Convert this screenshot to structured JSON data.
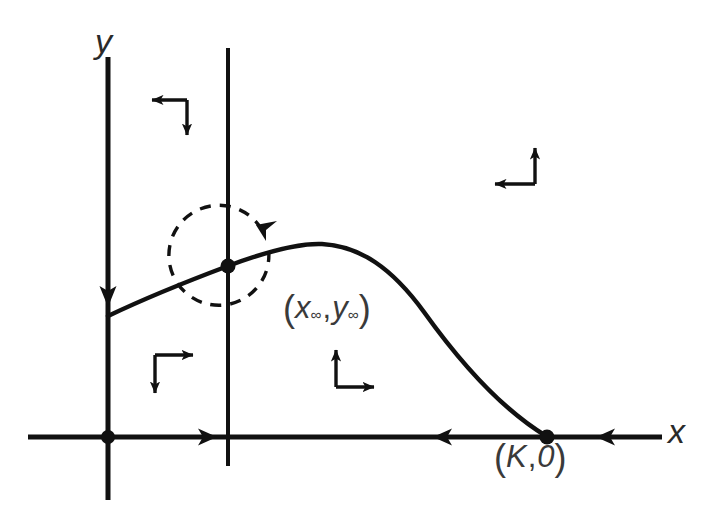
{
  "figure": {
    "background_color": "#ffffff",
    "stroke_color": "#1a1a1a",
    "text_color": "#3a3a3a"
  },
  "axes": {
    "y_label": "y",
    "x_label": "x",
    "x_axis": {
      "y_pixel": 437,
      "x_start": 28,
      "x_end": 662
    },
    "y_axis": {
      "x_pixel": 108,
      "y_start": 57,
      "y_end": 500
    }
  },
  "nullcline": {
    "name": "vertical-nullcline",
    "x_pixel": 228,
    "y_start": 48,
    "y_end": 466
  },
  "points": [
    {
      "name": "origin",
      "label": "",
      "x": 108,
      "y": 437
    },
    {
      "name": "equilibrium",
      "label": "(x∞,y∞)",
      "label_parts": {
        "open": "(",
        "first_var": "x",
        "first_sub": "∞",
        "comma": ",",
        "second_var": "y",
        "second_sub": "∞",
        "close": ")"
      },
      "x": 228,
      "y": 266
    },
    {
      "name": "carrying-capacity",
      "label": "(K,0)",
      "label_parts": {
        "open": "(",
        "first_var": "K",
        "comma": ",",
        "second_var": "0",
        "close": ")"
      },
      "x": 547,
      "y": 437
    }
  ],
  "trajectory": {
    "name": "solution-curve",
    "description": "Orbit from y-axis rising over the hump and falling into (K,0)"
  },
  "spiral_arrow": {
    "name": "counterclockwise-spiral",
    "center_x": 228,
    "center_y": 266,
    "radius": 50,
    "direction": "counterclockwise"
  },
  "direction_field": [
    {
      "name": "quadrant-upper-left",
      "horizontal": "left",
      "vertical": "down",
      "corner_x": 187,
      "corner_y": 100
    },
    {
      "name": "quadrant-upper-right",
      "horizontal": "left",
      "vertical": "up",
      "corner_x": 535,
      "corner_y": 184
    },
    {
      "name": "quadrant-lower-left",
      "horizontal": "right",
      "vertical": "down",
      "corner_x": 155,
      "corner_y": 355
    },
    {
      "name": "quadrant-lower-middle",
      "horizontal": "right",
      "vertical": "up",
      "corner_x": 336,
      "corner_y": 387
    }
  ],
  "flow_arrowheads": [
    {
      "name": "x-axis-arrow-right",
      "x": 215,
      "y": 437,
      "direction": "right"
    },
    {
      "name": "x-axis-arrow-left-inner",
      "x": 435,
      "y": 437,
      "direction": "left"
    },
    {
      "name": "x-axis-arrow-left-outer",
      "x": 598,
      "y": 437,
      "direction": "left"
    },
    {
      "name": "y-axis-arrow-down",
      "x": 108,
      "y": 305,
      "direction": "down"
    }
  ]
}
